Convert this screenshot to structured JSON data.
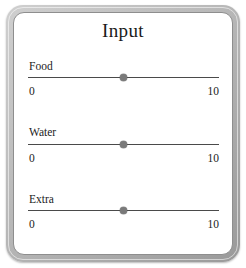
{
  "panel": {
    "title": "Input",
    "frame_color": "#b4b4b4",
    "background_color": "#ffffff",
    "track_color": "#4a4a4a",
    "thumb_color": "#7a7a7a"
  },
  "sliders": [
    {
      "label": "Food",
      "min_label": "0",
      "max_label": "10",
      "min": 0,
      "max": 10,
      "value": 5,
      "thumb_percent": 50
    },
    {
      "label": "Water",
      "min_label": "0",
      "max_label": "10",
      "min": 0,
      "max": 10,
      "value": 5,
      "thumb_percent": 50
    },
    {
      "label": "Extra",
      "min_label": "0",
      "max_label": "10",
      "min": 0,
      "max": 10,
      "value": 5,
      "thumb_percent": 50
    }
  ]
}
